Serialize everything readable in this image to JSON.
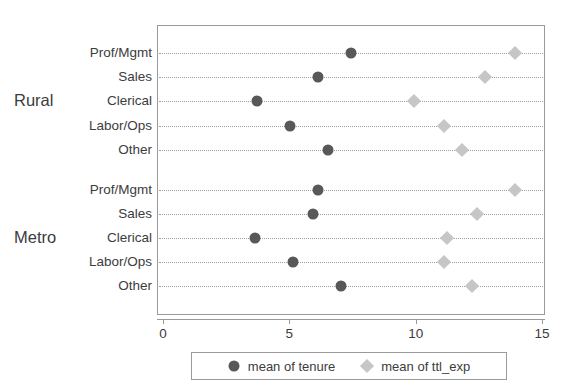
{
  "chart_data": {
    "type": "scatter",
    "title": "",
    "xlabel": "",
    "ylabel": "",
    "xlim": [
      0,
      15
    ],
    "xticks": [
      0,
      5,
      10,
      15
    ],
    "xtick_labels": [
      "0",
      "5",
      "10",
      "15"
    ],
    "grid": "horizontal-dotted",
    "legend_position": "bottom-center",
    "orientation": "horizontal",
    "groups": [
      {
        "name": "Rural",
        "categories": [
          "Prof/Mgmt",
          "Sales",
          "Clerical",
          "Labor/Ops",
          "Other"
        ],
        "series": [
          {
            "name": "mean of tenure",
            "values": [
              7.4,
              6.1,
              3.7,
              5.0,
              6.5
            ]
          },
          {
            "name": "mean of ttl_exp",
            "values": [
              13.9,
              12.7,
              9.9,
              11.1,
              11.8
            ]
          }
        ]
      },
      {
        "name": "Metro",
        "categories": [
          "Prof/Mgmt",
          "Sales",
          "Clerical",
          "Labor/Ops",
          "Other"
        ],
        "series": [
          {
            "name": "mean of tenure",
            "values": [
              6.1,
              5.9,
              3.6,
              5.1,
              7.0
            ]
          },
          {
            "name": "mean of ttl_exp",
            "values": [
              13.9,
              12.4,
              11.2,
              11.1,
              12.2
            ]
          }
        ]
      }
    ],
    "series_styles": [
      {
        "name": "mean of tenure",
        "marker": "circle",
        "color": "#585858"
      },
      {
        "name": "mean of ttl_exp",
        "marker": "diamond",
        "color": "#c6c6c6"
      }
    ]
  },
  "legend": {
    "items": [
      {
        "label": "mean of tenure",
        "marker": "circle-marker-icon"
      },
      {
        "label": "mean of ttl_exp",
        "marker": "diamond-marker-icon"
      }
    ]
  },
  "axis": {
    "frame_color": "#9a9a9a",
    "grid_color": "#9f9f9f",
    "text_color": "#3c3c3c"
  }
}
